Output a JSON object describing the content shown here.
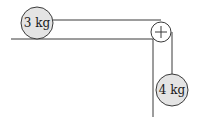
{
  "diagram": {
    "type": "physics-pulley-system",
    "colors": {
      "line": "#3a3a3a",
      "mass_fill": "#e4e4e4",
      "pulley_fill": "#ffffff",
      "background": "#ffffff"
    },
    "masses": [
      {
        "id": "table-mass",
        "label": "3 kg",
        "cx": 37,
        "cy": 24,
        "r": 16
      },
      {
        "id": "hanging-mass",
        "label": "4 kg",
        "cx": 172,
        "cy": 90,
        "r": 16
      }
    ],
    "pulley": {
      "cx": 161,
      "cy": 32,
      "r": 9
    },
    "table": {
      "top_y": 39,
      "left_x": 11,
      "edge_x": 153,
      "bottom_y": 117
    },
    "string": {
      "horizontal_y": 20,
      "start_x": 53,
      "vertical_x": 172,
      "end_y": 74
    }
  }
}
